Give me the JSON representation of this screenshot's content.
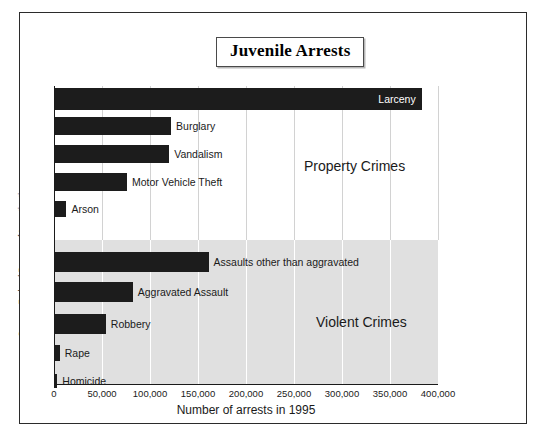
{
  "figure": {
    "title": "Juvenile Arrests",
    "source": "Source: Federal Bureau of Investigation"
  },
  "chart_data": {
    "type": "bar",
    "orientation": "horizontal",
    "title": "Juvenile Arrests",
    "xlabel": "Number of arrests in 1995",
    "ylabel": "",
    "xlim": [
      0,
      400000
    ],
    "xticks": [
      0,
      50000,
      100000,
      150000,
      200000,
      250000,
      300000,
      350000,
      400000
    ],
    "xtick_labels": [
      "0",
      "50,000",
      "100,000",
      "150,000",
      "200,000",
      "250,000",
      "300,000",
      "350,000",
      "400,000"
    ],
    "grid": "vertical",
    "legend": "none",
    "bar_color": "#1c1c1c",
    "groups": [
      {
        "name": "Property Crimes",
        "background": "#ffffff",
        "categories": [
          "Larceny",
          "Burglary",
          "Vandalism",
          "Motor Vehicle Theft",
          "Arson"
        ],
        "values": [
          383000,
          122000,
          120000,
          76000,
          13000
        ],
        "label_placement": [
          "inside",
          "outside",
          "outside",
          "outside",
          "outside"
        ]
      },
      {
        "name": "Violent Crimes",
        "background": "#e0e0e0",
        "categories": [
          "Assaults other than aggravated",
          "Aggravated Assault",
          "Robbery",
          "Rape",
          "Homicide"
        ],
        "values": [
          161000,
          82000,
          54000,
          6000,
          3500
        ],
        "label_placement": [
          "outside",
          "outside",
          "outside",
          "outside",
          "outside"
        ]
      }
    ]
  }
}
